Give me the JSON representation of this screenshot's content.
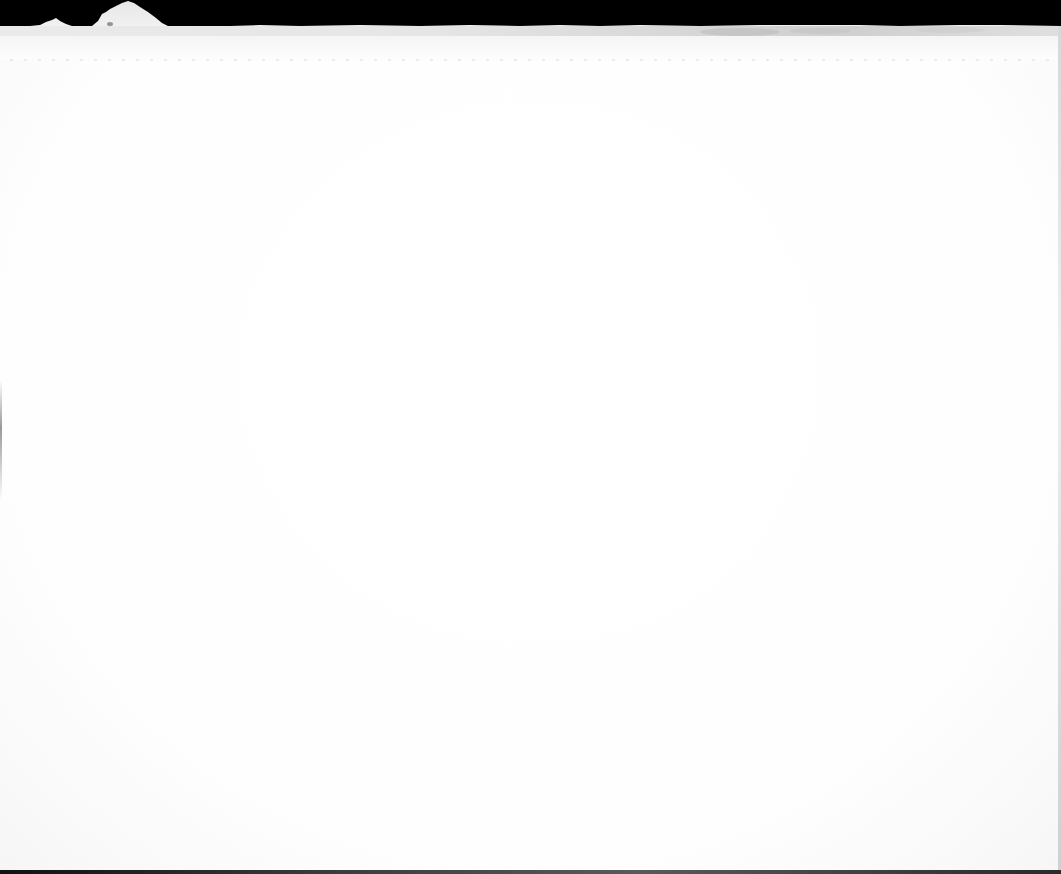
{
  "image": {
    "description": "Overexposed photograph of a bright white terrain/horizon under a black sky",
    "colors": {
      "sky": "#000000",
      "horizon_grey": "#c8c8c8",
      "terrain_white": "#f4f4f4",
      "ground_wash": "#fdfdfd",
      "bottom_edge": "#222222"
    },
    "features": [
      {
        "name": "black-sky-band",
        "top": 0,
        "height": 27
      },
      {
        "name": "large-peak",
        "x_start": 95,
        "x_end": 168,
        "apex_x": 128,
        "apex_y": 1
      },
      {
        "name": "small-peak",
        "x_start": 40,
        "x_end": 68,
        "apex_x": 56,
        "apex_y": 19
      },
      {
        "name": "grey-horizon-band",
        "top": 24,
        "bottom": 40
      },
      {
        "name": "overexposed-foreground",
        "top": 40,
        "bottom": 870
      },
      {
        "name": "dark-bottom-edge",
        "top": 870,
        "bottom": 874
      }
    ]
  }
}
